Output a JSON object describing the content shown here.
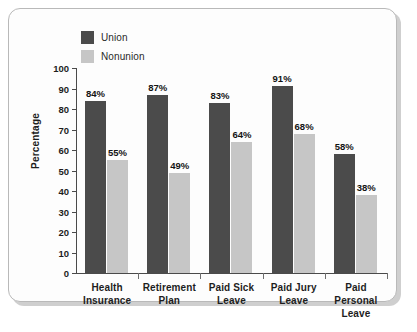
{
  "chart_data": {
    "type": "bar",
    "title": "",
    "xlabel": "",
    "ylabel": "Percentage",
    "ylim": [
      0,
      100
    ],
    "ytick_step": 10,
    "yticks": [
      100,
      90,
      80,
      70,
      60,
      50,
      40,
      30,
      20,
      10,
      0
    ],
    "grid": false,
    "legend_position": "top-left",
    "categories": [
      "Health Insurance",
      "Retirement Plan",
      "Paid Sick Leave",
      "Paid Jury Leave",
      "Paid Personal Leave"
    ],
    "category_lines": [
      [
        "Health",
        "Insurance"
      ],
      [
        "Retirement",
        "Plan"
      ],
      [
        "Paid Sick",
        "Leave"
      ],
      [
        "Paid Jury",
        "Leave"
      ],
      [
        "Paid Personal",
        "Leave"
      ]
    ],
    "series": [
      {
        "name": "Union",
        "color": "#4b4b4b",
        "values": [
          84,
          87,
          83,
          91,
          58
        ],
        "labels": [
          "84%",
          "87%",
          "83%",
          "91%",
          "58%"
        ]
      },
      {
        "name": "Nonunion",
        "color": "#c6c6c6",
        "values": [
          55,
          49,
          64,
          68,
          38
        ],
        "labels": [
          "55%",
          "49%",
          "64%",
          "68%",
          "38%"
        ]
      }
    ]
  },
  "legend": {
    "items": [
      {
        "label": "Union",
        "color": "#4b4b4b"
      },
      {
        "label": "Nonunion",
        "color": "#c6c6c6"
      }
    ]
  },
  "axis": {
    "y_title": "Percentage",
    "y_tick_labels": [
      "100",
      "90",
      "80",
      "70",
      "60",
      "50",
      "40",
      "30",
      "20",
      "10",
      "0"
    ]
  }
}
